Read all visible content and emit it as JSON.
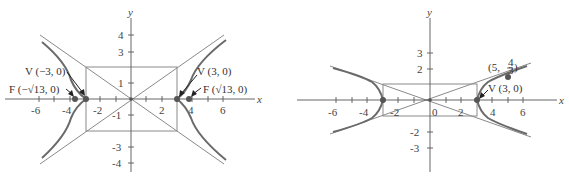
{
  "graph_left": {
    "equation": "x^2/9 - y^2/4 = 1",
    "axis_labels": {
      "x": "x",
      "y": "y"
    },
    "x_tick_labels": [
      "-6",
      "-4",
      "-2",
      "2",
      "4",
      "6"
    ],
    "y_tick_labels": [
      "4",
      "3",
      "1",
      "-1",
      "-3",
      "-4"
    ],
    "annotations": {
      "vertex_left": "V (−3, 0)",
      "vertex_right": "V (3, 0)",
      "focus_left": "F (−√13, 0)",
      "focus_right": "F (√13, 0)"
    },
    "vertices": [
      [
        -3,
        0
      ],
      [
        3,
        0
      ]
    ],
    "foci": [
      [
        -3.606,
        0
      ],
      [
        3.606,
        0
      ]
    ],
    "fundamental_rectangle": {
      "x": [
        -3,
        3
      ],
      "y": [
        -2,
        2
      ]
    },
    "asymptotes": [
      "y = 2x/3",
      "y = -2x/3"
    ]
  },
  "graph_right": {
    "equation": "x^2/9 - y^2 = 1",
    "axis_labels": {
      "x": "x",
      "y": "y"
    },
    "x_tick_labels": [
      "-6",
      "-4",
      "-2",
      "0",
      "2",
      "4",
      "6"
    ],
    "y_tick_labels": [
      "3",
      "2",
      "-2",
      "-3"
    ],
    "annotations": {
      "vertex_right": "V (3, 0)",
      "point": "(5, 4/3)",
      "point_num": "4",
      "point_den": "3",
      "point_prefix": "(5, ",
      "point_suffix": ")"
    },
    "vertices": [
      [
        -3,
        0
      ],
      [
        3,
        0
      ]
    ],
    "marked_point": [
      5,
      1.333
    ],
    "fundamental_rectangle": {
      "x": [
        -3,
        3
      ],
      "y": [
        -1,
        1
      ]
    },
    "asymptotes": [
      "y = x/3",
      "y = -x/3"
    ]
  }
}
